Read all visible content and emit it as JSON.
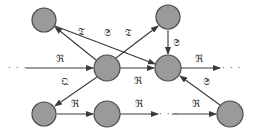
{
  "diagram": {
    "type": "directed-graph",
    "colors": {
      "node_fill": "#9a9a9a",
      "node_stroke": "#4a4a4a",
      "edge": "#3a3a3a",
      "label": "#333333"
    },
    "nodes": [
      {
        "id": "n1",
        "x": 44,
        "y": 20
      },
      {
        "id": "n2",
        "x": 168,
        "y": 17
      },
      {
        "id": "n3",
        "x": 107,
        "y": 68
      },
      {
        "id": "n4",
        "x": 168,
        "y": 68
      },
      {
        "id": "n5",
        "x": 44,
        "y": 114
      },
      {
        "id": "n6",
        "x": 107,
        "y": 114
      },
      {
        "id": "n7",
        "x": 230,
        "y": 114
      }
    ],
    "labels": {
      "e_dots_n3": "ℜ",
      "e_n3_n1": "𝔗",
      "e_n1_n4": "𝔖",
      "e_n3_n2": "𝔗",
      "e_n2_n4": "𝔖",
      "e_n3_n4": "ℜ",
      "e_n4_dots": "ℜ",
      "e_n3_n5": "𝔔",
      "e_n5_n6": "ℜ",
      "e_n6_dots": "ℜ",
      "e_dots_n7": "ℜ",
      "e_n7_n4": "𝔖"
    },
    "ellipsis": "· · ·"
  }
}
